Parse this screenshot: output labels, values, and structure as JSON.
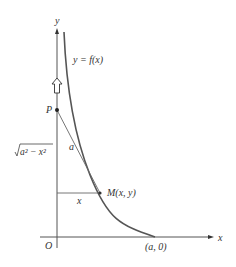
{
  "figure": {
    "axes": {
      "x_label": "x",
      "y_label": "y",
      "origin_label": "O"
    },
    "curve": {
      "label": "y = f(x)",
      "endpoint_label": "(a, 0)"
    },
    "points": {
      "P": "P",
      "M": "M(x, y)"
    },
    "segments": {
      "tangent_length": "a",
      "horizontal_length": "x",
      "vertical_length_radicand": "a² − x²"
    },
    "colors": {
      "ink": "#333333",
      "curve": "#555555",
      "background": "#ffffff"
    }
  }
}
